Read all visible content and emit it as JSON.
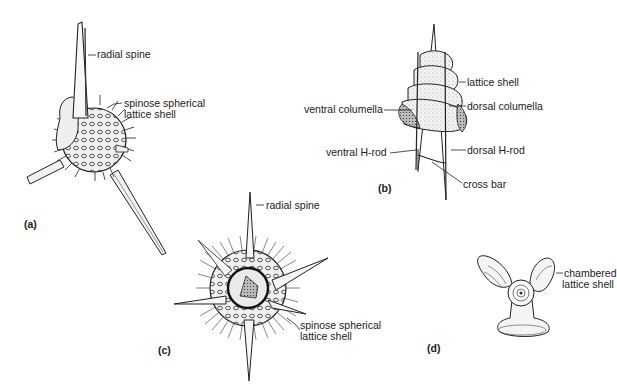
{
  "figure": {
    "panels": [
      {
        "id": "a",
        "label": "(a)",
        "annotations": {
          "radial_spine": "radial spine",
          "shell_line1": "spinose spherical",
          "shell_line2": "lattice shell"
        }
      },
      {
        "id": "b",
        "label": "(b)",
        "annotations": {
          "lattice_shell": "lattice shell",
          "ventral_columella": "ventral columella",
          "dorsal_columella": "dorsal columella",
          "ventral_h_rod": "ventral H-rod",
          "dorsal_h_rod": "dorsal H-rod",
          "cross_bar": "cross bar"
        }
      },
      {
        "id": "c",
        "label": "(c)",
        "annotations": {
          "radial_spine": "radial spine",
          "shell_line1": "spinose spherical",
          "shell_line2": "lattice shell"
        }
      },
      {
        "id": "d",
        "label": "(d)",
        "annotations": {
          "shell_line1": "chambered",
          "shell_line2": "lattice shell"
        }
      }
    ],
    "colors": {
      "ink": "#1a1a1a",
      "background": "#ffffff",
      "stipple": "#d8d8d8"
    }
  }
}
